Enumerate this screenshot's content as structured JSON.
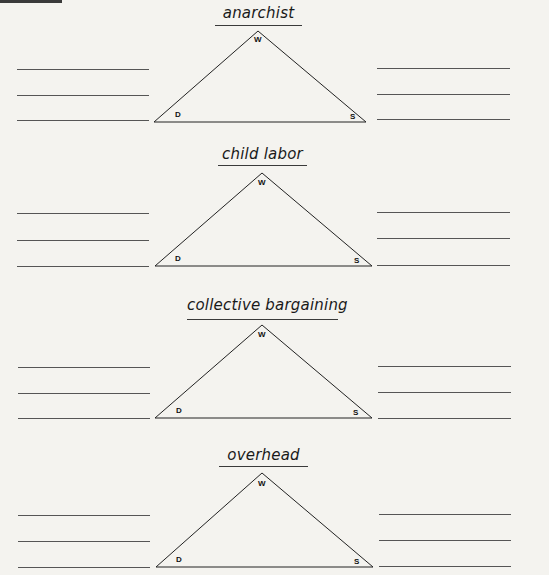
{
  "worksheet": {
    "vertex_labels": {
      "top": "W",
      "left": "D",
      "right": "S"
    },
    "terms": [
      {
        "term": "anarchist"
      },
      {
        "term": "child labor"
      },
      {
        "term": "collective bargaining"
      },
      {
        "term": "overhead"
      }
    ],
    "line_color": "#555555",
    "background_color": "#f4f3ef"
  }
}
